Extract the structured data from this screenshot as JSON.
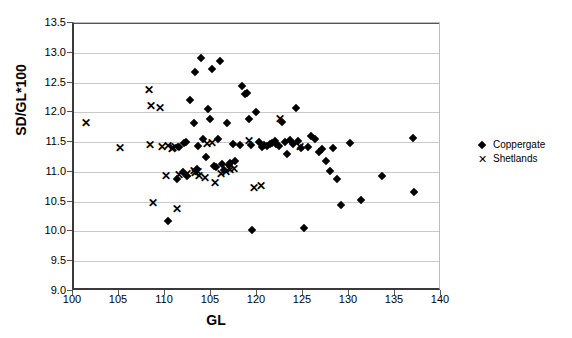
{
  "chart_data": {
    "type": "scatter",
    "title": "",
    "xlabel": "GL",
    "ylabel": "SD/GL*100",
    "xlim": [
      100,
      140
    ],
    "ylim": [
      9.0,
      13.5
    ],
    "grid": true,
    "legend_position": "right",
    "xticks": [
      "100",
      "105",
      "110",
      "105",
      "120",
      "125",
      "130",
      "135",
      "140"
    ],
    "xtick_values": [
      100,
      105,
      110,
      115,
      120,
      125,
      130,
      135,
      140
    ],
    "yticks": [
      "9.0",
      "9.5",
      "10.0",
      "10.5",
      "11.0",
      "11.5",
      "12.0",
      "12.5",
      "13.0",
      "13.5"
    ],
    "ytick_values": [
      9.0,
      9.5,
      10.0,
      10.5,
      11.0,
      11.5,
      12.0,
      12.5,
      13.0,
      13.5
    ],
    "series": [
      {
        "name": "Coppergate",
        "marker": "diamond",
        "color": "#000000",
        "points": [
          [
            110.2,
            10.17
          ],
          [
            111.2,
            10.88
          ],
          [
            111.4,
            11.42
          ],
          [
            111.8,
            11.0
          ],
          [
            112.0,
            11.48
          ],
          [
            112.2,
            11.5
          ],
          [
            112.3,
            10.93
          ],
          [
            112.6,
            12.2
          ],
          [
            113.0,
            11.82
          ],
          [
            113.2,
            12.67
          ],
          [
            113.4,
            11.05
          ],
          [
            113.5,
            11.43
          ],
          [
            113.8,
            12.92
          ],
          [
            114.0,
            11.55
          ],
          [
            114.3,
            11.25
          ],
          [
            114.6,
            12.05
          ],
          [
            114.8,
            11.88
          ],
          [
            115.0,
            12.72
          ],
          [
            115.2,
            11.1
          ],
          [
            115.4,
            11.08
          ],
          [
            115.6,
            11.55
          ],
          [
            115.9,
            12.86
          ],
          [
            116.1,
            11.13
          ],
          [
            116.3,
            11.03
          ],
          [
            116.6,
            11.82
          ],
          [
            116.8,
            11.12
          ],
          [
            117.0,
            11.15
          ],
          [
            117.3,
            11.47
          ],
          [
            117.5,
            11.18
          ],
          [
            118.0,
            11.45
          ],
          [
            118.3,
            12.45
          ],
          [
            118.6,
            12.3
          ],
          [
            118.8,
            12.33
          ],
          [
            119.0,
            11.88
          ],
          [
            119.2,
            11.45
          ],
          [
            119.4,
            10.03
          ],
          [
            119.8,
            12.0
          ],
          [
            120.1,
            11.5
          ],
          [
            120.4,
            11.42
          ],
          [
            120.7,
            11.45
          ],
          [
            121.0,
            11.43
          ],
          [
            121.3,
            11.47
          ],
          [
            121.5,
            11.49
          ],
          [
            121.8,
            11.52
          ],
          [
            122.0,
            11.46
          ],
          [
            122.3,
            11.44
          ],
          [
            122.6,
            11.84
          ],
          [
            122.9,
            11.5
          ],
          [
            123.2,
            11.3
          ],
          [
            123.5,
            11.53
          ],
          [
            123.8,
            11.47
          ],
          [
            124.1,
            12.08
          ],
          [
            124.4,
            11.52
          ],
          [
            124.7,
            11.4
          ],
          [
            125.0,
            10.06
          ],
          [
            125.4,
            11.42
          ],
          [
            125.8,
            11.6
          ],
          [
            126.2,
            11.55
          ],
          [
            126.6,
            11.33
          ],
          [
            127.0,
            11.38
          ],
          [
            127.4,
            11.18
          ],
          [
            127.8,
            11.02
          ],
          [
            128.2,
            11.4
          ],
          [
            128.6,
            10.88
          ],
          [
            129.0,
            10.45
          ],
          [
            130.0,
            11.48
          ],
          [
            131.2,
            10.52
          ],
          [
            133.5,
            10.93
          ],
          [
            136.8,
            11.57
          ],
          [
            137.0,
            10.67
          ]
        ]
      },
      {
        "name": "Shetlands",
        "marker": "cross",
        "color": "#000000",
        "points": [
          [
            101.3,
            11.82
          ],
          [
            105.0,
            11.4
          ],
          [
            108.2,
            12.38
          ],
          [
            108.3,
            11.45
          ],
          [
            108.4,
            12.1
          ],
          [
            108.6,
            10.47
          ],
          [
            109.3,
            12.07
          ],
          [
            109.6,
            11.41
          ],
          [
            110.0,
            10.93
          ],
          [
            110.2,
            11.43
          ],
          [
            110.6,
            11.38
          ],
          [
            110.8,
            11.4
          ],
          [
            111.0,
            11.42
          ],
          [
            111.2,
            10.37
          ],
          [
            111.4,
            10.95
          ],
          [
            112.3,
            10.97
          ],
          [
            113.0,
            11.02
          ],
          [
            113.2,
            10.98
          ],
          [
            113.5,
            11.0
          ],
          [
            113.6,
            10.93
          ],
          [
            114.2,
            10.9
          ],
          [
            114.5,
            11.47
          ],
          [
            115.0,
            11.48
          ],
          [
            115.3,
            10.82
          ],
          [
            116.0,
            10.96
          ],
          [
            116.5,
            11.0
          ],
          [
            117.0,
            11.03
          ],
          [
            117.4,
            11.05
          ],
          [
            119.0,
            11.52
          ],
          [
            119.6,
            10.73
          ],
          [
            120.3,
            10.77
          ],
          [
            122.4,
            11.88
          ],
          [
            124.6,
            11.42
          ]
        ]
      }
    ]
  }
}
